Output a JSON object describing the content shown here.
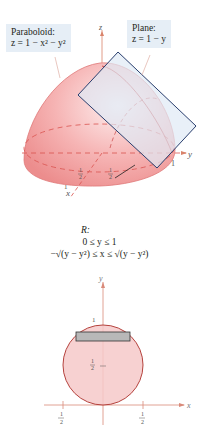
{
  "figure3d": {
    "paraboloid_label": {
      "title": "Paraboloid:",
      "equation": "z = 1 − x² − y²"
    },
    "plane_label": {
      "title": "Plane:",
      "equation": "z = 1 − y"
    },
    "axes": {
      "z": "z",
      "y": "y",
      "x": "x"
    },
    "ticks": {
      "y_one": "1",
      "x_one": "1",
      "half_x": "1/2",
      "half_y": "1/2"
    },
    "colors": {
      "surface": "#f19a9a",
      "surface_light": "#fbe1e1",
      "edge": "#d9534f",
      "plane_fill": "#dfe9f5",
      "plane_edge": "#2a3f6e",
      "label_bg": "#e6eef6"
    }
  },
  "region": {
    "title": "R:",
    "line1": "0 ≤ y ≤ 1",
    "line2": "−√(y − y²) ≤ x ≤ √(y − y²)"
  },
  "figure2d": {
    "axes": {
      "x": "x",
      "y": "y"
    },
    "ticks": {
      "y_one": "1",
      "y_half": "1/2",
      "x_neg_half": "−1/2",
      "x_pos_half": "1/2"
    },
    "colors": {
      "disk_fill": "#f6c9c9",
      "disk_edge": "#b5423d",
      "strip_fill": "#b8b8b8",
      "strip_edge": "#333333",
      "axis": "#d98a7a"
    }
  }
}
